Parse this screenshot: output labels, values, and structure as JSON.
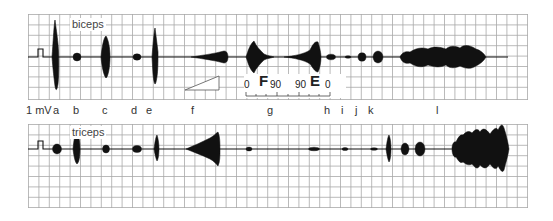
{
  "figure": {
    "type": "EMG recording comparison",
    "panels": [
      {
        "id": "top",
        "muscle_label": "biceps"
      },
      {
        "id": "bottom",
        "muscle_label": "triceps"
      }
    ],
    "calibration_label": "1 mV",
    "condition_labels": [
      "a",
      "b",
      "c",
      "d",
      "e",
      "f",
      "g",
      "h",
      "i",
      "j",
      "k",
      "l"
    ],
    "ramp_icon": "ramp-triangle",
    "angle_scale": {
      "left_zero": "0",
      "flexion_letter": "F",
      "flexion_angle": "90",
      "extension_angle": "90",
      "extension_letter": "E",
      "right_zero": "0"
    },
    "colors": {
      "grid": "#9a9a9a",
      "trace": "#111111",
      "background": "#ffffff"
    }
  }
}
